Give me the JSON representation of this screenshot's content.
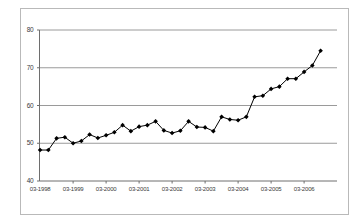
{
  "chart_data": {
    "type": "line",
    "title": "",
    "subtitle": "",
    "xlabel": "",
    "ylabel": "",
    "xlim_labels": [
      "03-1998",
      "03-2006"
    ],
    "ylim": [
      40,
      80
    ],
    "yticks": [
      40,
      50,
      60,
      70,
      80
    ],
    "ytick_labels": [
      "40",
      "50",
      "60",
      "70",
      "80"
    ],
    "xticks": [
      "03-1998",
      "03-1999",
      "03-2000",
      "03-2001",
      "03-2002",
      "03-2003",
      "03-2004",
      "03-2005",
      "03-2006"
    ],
    "grid": true,
    "grid_axis": "y",
    "legend": null,
    "legend_position": "none",
    "marker": "filled-diamond",
    "marker_color": "#000000",
    "line_color": "#000000",
    "series": [
      {
        "name": "series-1",
        "x": [
          "03-1998",
          "06-1998",
          "09-1998",
          "12-1998",
          "03-1999",
          "06-1999",
          "09-1999",
          "12-1999",
          "03-2000",
          "06-2000",
          "09-2000",
          "12-2000",
          "03-2001",
          "06-2001",
          "09-2001",
          "12-2001",
          "03-2002",
          "06-2002",
          "09-2002",
          "12-2002",
          "03-2003",
          "06-2003",
          "09-2003",
          "12-2003",
          "03-2004",
          "06-2004",
          "09-2004",
          "12-2004",
          "03-2005",
          "06-2005",
          "09-2005",
          "12-2005",
          "03-2006",
          "06-2006",
          "09-2006"
        ],
        "values": [
          48.2,
          48.2,
          51.3,
          51.6,
          50.0,
          50.6,
          52.3,
          51.4,
          52.1,
          52.9,
          54.8,
          53.2,
          54.4,
          54.8,
          55.8,
          53.4,
          52.7,
          53.3,
          55.8,
          54.3,
          54.2,
          53.2,
          57.0,
          56.3,
          56.1,
          57.0,
          62.3,
          62.6,
          64.4,
          65.0,
          67.1,
          67.1,
          68.9,
          70.6,
          74.5
        ]
      }
    ]
  }
}
